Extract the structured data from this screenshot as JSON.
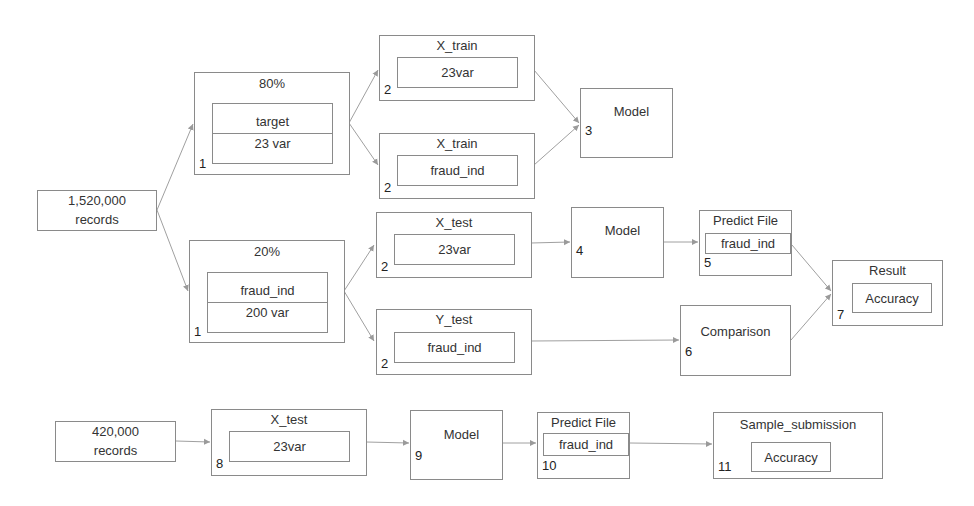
{
  "diagram": {
    "nodes": {
      "records_train": {
        "line1": "1,520,000",
        "line2": "records"
      },
      "split80": {
        "title": "80%",
        "inner_top": "target",
        "inner_bottom": "23 var",
        "step": "1"
      },
      "split20": {
        "title": "20%",
        "inner_top": "fraud_ind",
        "inner_bottom": "200 var",
        "step": "1"
      },
      "xtrain_vars": {
        "title": "X_train",
        "inner": "23var",
        "step": "2"
      },
      "xtrain_fraud": {
        "title": "X_train",
        "inner": "fraud_ind",
        "step": "2"
      },
      "model3": {
        "title": "Model",
        "step": "3"
      },
      "xtest_vars": {
        "title": "X_test",
        "inner": "23var",
        "step": "2"
      },
      "ytest_fraud": {
        "title": "Y_test",
        "inner": "fraud_ind",
        "step": "2"
      },
      "model4": {
        "title": "Model",
        "step": "4"
      },
      "predict5": {
        "title": "Predict File",
        "inner": "fraud_ind",
        "step": "5"
      },
      "comparison6": {
        "title": "Comparison",
        "step": "6"
      },
      "result7": {
        "title": "Result",
        "inner": "Accuracy",
        "step": "7"
      },
      "records_test": {
        "line1": "420,000",
        "line2": "records"
      },
      "xtest8": {
        "title": "X_test",
        "inner": "23var",
        "step": "8"
      },
      "model9": {
        "title": "Model",
        "step": "9"
      },
      "predict10": {
        "title": "Predict File",
        "inner": "fraud_ind",
        "step": "10"
      },
      "submission11": {
        "title": "Sample_submission",
        "inner": "Accuracy",
        "step": "11"
      }
    },
    "edges": [
      [
        "records_train",
        "split80"
      ],
      [
        "records_train",
        "split20"
      ],
      [
        "split80",
        "xtrain_vars"
      ],
      [
        "split80",
        "xtrain_fraud"
      ],
      [
        "xtrain_vars",
        "model3"
      ],
      [
        "xtrain_fraud",
        "model3"
      ],
      [
        "split20",
        "xtest_vars"
      ],
      [
        "split20",
        "ytest_fraud"
      ],
      [
        "xtest_vars",
        "model4"
      ],
      [
        "model4",
        "predict5"
      ],
      [
        "ytest_fraud",
        "comparison6"
      ],
      [
        "predict5",
        "result7"
      ],
      [
        "comparison6",
        "result7"
      ],
      [
        "records_test",
        "xtest8"
      ],
      [
        "xtest8",
        "model9"
      ],
      [
        "model9",
        "predict10"
      ],
      [
        "predict10",
        "submission11"
      ]
    ],
    "colors": {
      "border": "#8a8a8a",
      "edge": "#9a9a9a",
      "text": "#333333"
    }
  }
}
